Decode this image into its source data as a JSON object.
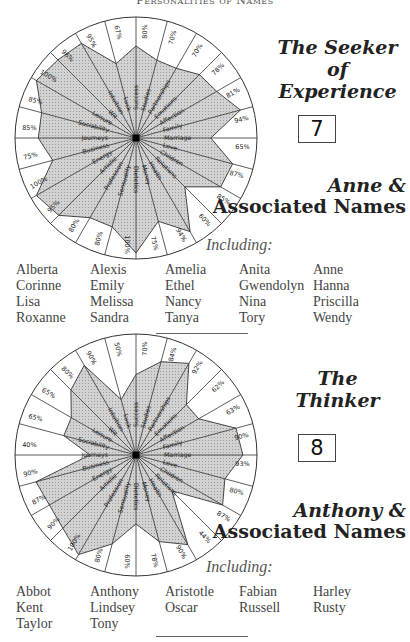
{
  "header": {
    "title": "Personalities of Names"
  },
  "categories": [
    "Success",
    "Studies",
    "Partnerships",
    "Emotions",
    "Affection",
    "Family",
    "Marriage",
    "Love",
    "Children",
    "Relations",
    "Health",
    "Money",
    "Dietetics",
    "Sensuality",
    "Profession",
    "Artistic",
    "Energy",
    "Business",
    "Journeys",
    "Sociability",
    "Leisure",
    "Wit",
    "Intuition",
    "Luck"
  ],
  "sections": [
    {
      "title_line1": "The Seeker",
      "title_line2": "of Experience",
      "number": "7",
      "assoc_line1": "Anne &",
      "assoc_line2": "Associated Names",
      "including_label": "Including:",
      "names": [
        "Alberta",
        "Alexis",
        "Amelia",
        "Anita",
        "Anne",
        "Corinne",
        "Emily",
        "Ethel",
        "Gwendolyn",
        "Hanna",
        "Lisa",
        "Melissa",
        "Nancy",
        "Nina",
        "Priscilla",
        "Roxanne",
        "Sandra",
        "Tanya",
        "Tory",
        "Wendy"
      ]
    },
    {
      "title_line1": "The",
      "title_line2": "Thinker",
      "number": "8",
      "assoc_line1": "Anthony &",
      "assoc_line2": "Associated Names",
      "including_label": "Including:",
      "names": [
        "Abbot",
        "Anthony",
        "Aristotle",
        "Fabian",
        "Harley",
        "Kent",
        "Lindsey",
        "Oscar",
        "Russell",
        "Rusty",
        "Taylor",
        "Tony"
      ]
    }
  ],
  "chart_data": [
    {
      "type": "radar",
      "title": "The Seeker of Experience (7) — Anne & Associated Names",
      "categories": [
        "Success",
        "Studies",
        "Partnerships",
        "Emotions",
        "Affection",
        "Family",
        "Marriage",
        "Love",
        "Children",
        "Relations",
        "Health",
        "Money",
        "Dietetics",
        "Sensuality",
        "Profession",
        "Artistic",
        "Energy",
        "Business",
        "Journeys",
        "Sociability",
        "Leisure",
        "Wit",
        "Intuition",
        "Luck"
      ],
      "values": [
        80,
        70,
        70,
        78,
        81,
        94,
        65,
        87,
        85,
        60,
        94,
        75,
        100,
        80,
        80,
        95,
        100,
        75,
        85,
        85,
        100,
        96,
        95,
        67
      ],
      "unit": "%",
      "range": [
        0,
        100
      ]
    },
    {
      "type": "radar",
      "title": "The Thinker (8) — Anthony & Associated Names",
      "categories": [
        "Success",
        "Studies",
        "Partnerships",
        "Emotions",
        "Affection",
        "Family",
        "Marriage",
        "Love",
        "Children",
        "Relations",
        "Health",
        "Money",
        "Dietetics",
        "Sensuality",
        "Profession",
        "Artistic",
        "Energy",
        "Business",
        "Journeys",
        "Sociability",
        "Leisure",
        "Wit",
        "Intuition",
        "Luck"
      ],
      "values": [
        70,
        84,
        92,
        62,
        63,
        90,
        93,
        80,
        87,
        44,
        90,
        78,
        60,
        80,
        100,
        90,
        87,
        90,
        40,
        65,
        65,
        80,
        90,
        50
      ],
      "unit": "%",
      "range": [
        0,
        100
      ]
    }
  ]
}
